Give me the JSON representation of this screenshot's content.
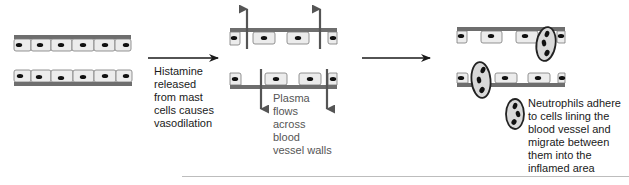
{
  "figure": {
    "type": "process-diagram",
    "colors": {
      "vessel_wall": "#6e6e6e",
      "cell_fill": "#ececec",
      "cell_border": "#7a7a7a",
      "nucleus": "#111111",
      "arrow": "#1a1a1a",
      "plasma_arrow": "#555555",
      "neutrophil_fill": "#d9d9d9",
      "neutrophil_border": "#222222",
      "text": "#1a1a1a",
      "plasma_text": "#555555",
      "footer_rule": "#bdbdbd"
    },
    "stages": [
      {
        "id": "stage-1",
        "name": "Normal blood vessel",
        "description": "Endothelial cells packed tightly with no gaps"
      },
      {
        "id": "stage-2",
        "name": "Vasodilated blood vessel",
        "description": "Gaps appear between endothelial cells; plasma moves outward through walls",
        "plasma_arrows": 4
      },
      {
        "id": "stage-3",
        "name": "Neutrophil migration",
        "description": "Neutrophils squeeze through gaps between endothelial cells",
        "neutrophils_shown": 3
      }
    ],
    "transitions": [
      {
        "from": "stage-1",
        "to": "stage-2",
        "caption_lines": [
          "Histamine",
          "released",
          "from mast",
          "cells causes",
          "vasodilation"
        ]
      },
      {
        "from": "stage-2",
        "to": "stage-3",
        "caption_lines": []
      }
    ],
    "annotations": {
      "plasma": [
        "Plasma",
        "flows",
        "across",
        "blood",
        "vessel walls"
      ],
      "neutrophils": [
        "Neutrophils adhere",
        "to cells lining the",
        "blood vessel and",
        "migrate between",
        "them into the",
        "inflamed area"
      ]
    }
  }
}
